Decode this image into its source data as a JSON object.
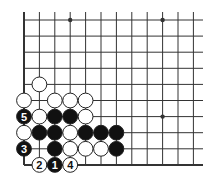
{
  "diagram": {
    "type": "go-board",
    "title": "",
    "grid": {
      "columns": 12,
      "rows": 10,
      "origin_x": 24,
      "origin_y": 20,
      "spacing_x": 15.4,
      "spacing_y": 16.1,
      "line_extent_right": 203,
      "line_extent_top": 12,
      "left_edge": true,
      "bottom_edge": true
    },
    "star_points": [
      {
        "col": 3,
        "row": 0
      },
      {
        "col": 9,
        "row": 0
      },
      {
        "col": 9,
        "row": 6
      }
    ],
    "stones": [
      {
        "color": "white",
        "col": 1,
        "row": 4,
        "label": ""
      },
      {
        "color": "white",
        "col": 0,
        "row": 5,
        "label": ""
      },
      {
        "color": "white",
        "col": 2,
        "row": 5,
        "label": ""
      },
      {
        "color": "white",
        "col": 3,
        "row": 5,
        "label": ""
      },
      {
        "color": "white",
        "col": 4,
        "row": 5,
        "label": ""
      },
      {
        "color": "black",
        "col": 0,
        "row": 6,
        "label": "5"
      },
      {
        "color": "white",
        "col": 1,
        "row": 6,
        "label": ""
      },
      {
        "color": "black",
        "col": 2,
        "row": 6,
        "label": ""
      },
      {
        "color": "black",
        "col": 3,
        "row": 6,
        "label": ""
      },
      {
        "color": "white",
        "col": 4,
        "row": 6,
        "label": ""
      },
      {
        "color": "white",
        "col": 0,
        "row": 7,
        "label": ""
      },
      {
        "color": "black",
        "col": 1,
        "row": 7,
        "label": ""
      },
      {
        "color": "black",
        "col": 2,
        "row": 7,
        "label": ""
      },
      {
        "color": "white",
        "col": 3,
        "row": 7,
        "label": ""
      },
      {
        "color": "black",
        "col": 4,
        "row": 7,
        "label": ""
      },
      {
        "color": "black",
        "col": 5,
        "row": 7,
        "label": ""
      },
      {
        "color": "black",
        "col": 6,
        "row": 7,
        "label": ""
      },
      {
        "color": "black",
        "col": 0,
        "row": 8,
        "label": "3"
      },
      {
        "color": "black",
        "col": 2,
        "row": 8,
        "label": ""
      },
      {
        "color": "white",
        "col": 3,
        "row": 8,
        "label": ""
      },
      {
        "color": "white",
        "col": 4,
        "row": 8,
        "label": ""
      },
      {
        "color": "white",
        "col": 5,
        "row": 8,
        "label": ""
      },
      {
        "color": "black",
        "col": 6,
        "row": 8,
        "label": ""
      },
      {
        "color": "white",
        "col": 1,
        "row": 9,
        "label": "2"
      },
      {
        "color": "black",
        "col": 2,
        "row": 9,
        "label": "1"
      },
      {
        "color": "white",
        "col": 3,
        "row": 9,
        "label": "4"
      }
    ],
    "colors": {
      "line": "#333333",
      "black_stone": "#111111",
      "white_stone": "#ffffff",
      "stone_outline": "#222222",
      "background": "#ffffff"
    }
  }
}
